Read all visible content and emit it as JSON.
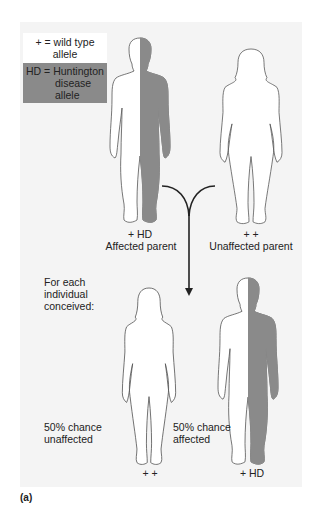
{
  "legend": {
    "wild_type_line1": "+ = wild type",
    "wild_type_line2": "allele",
    "hd_line1": "HD = Huntington",
    "hd_line2": "disease",
    "hd_line3": "allele",
    "wild_type_color": "#ffffff",
    "hd_color": "#8a8a8a"
  },
  "parents": {
    "affected": {
      "genotype": "+ HD",
      "label": "Affected parent",
      "sex": "male",
      "phenotype": "affected"
    },
    "unaffected": {
      "genotype": "+ +",
      "label": "Unaffected parent",
      "sex": "female",
      "phenotype": "unaffected"
    }
  },
  "offspring_heading": {
    "line1": "For each",
    "line2": "individual",
    "line3": "conceived:"
  },
  "offspring": {
    "unaffected": {
      "genotype": "+ +",
      "line1": "50% chance",
      "line2": "unaffected",
      "sex": "female"
    },
    "affected": {
      "genotype": "+ HD",
      "line1": "50% chance",
      "line2": "affected",
      "sex": "male"
    }
  },
  "panel_label": "(a)",
  "colors": {
    "panel_background": "#f4f4f4",
    "affected_fill": "#8a8a8a",
    "outline": "#555555"
  }
}
